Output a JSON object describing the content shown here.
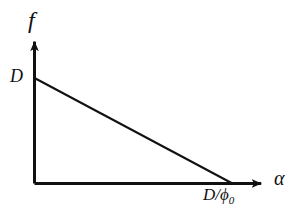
{
  "figure": {
    "background_color": "#ffffff",
    "line_color": "#111111",
    "axes": {
      "y_axis_label": "f",
      "x_axis_label": "α",
      "y_intercept_label": "D",
      "x_intercept_label_main": "D/",
      "x_intercept_label_phi": "ϕ",
      "x_intercept_label_sub": "0"
    }
  },
  "chart_data": {
    "type": "line",
    "title": "",
    "xlabel": "α",
    "ylabel": "f",
    "grid": false,
    "legend": null,
    "x": [
      0,
      1
    ],
    "series": [
      {
        "name": "f(α)",
        "values": [
          1,
          0
        ]
      }
    ],
    "xlim": [
      0,
      1.145
    ],
    "ylim": [
      0,
      1.345
    ],
    "xticks": [
      1
    ],
    "xticklabels": [
      "D/ϕ₀"
    ],
    "yticks": [
      1
    ],
    "yticklabels": [
      "D"
    ],
    "annotations": [
      {
        "text": "D",
        "x": 0,
        "y": 1,
        "note": "y-intercept of the descending line"
      },
      {
        "text": "D/ϕ₀",
        "x": 1,
        "y": 0,
        "note": "x-intercept where f reaches zero"
      }
    ]
  }
}
